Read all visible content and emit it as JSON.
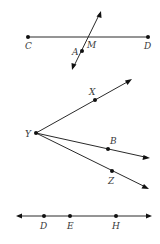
{
  "figures": {
    "segment_cd": {
      "labels": {
        "c": "C",
        "d": "D",
        "m": "M",
        "a": "A"
      },
      "description": "Segment CD with a line through M and point A crossing it"
    },
    "rays_y": {
      "labels": {
        "y": "Y",
        "x": "X",
        "b": "B",
        "z": "Z"
      },
      "description": "Three rays from common endpoint Y through X, B, and Z"
    },
    "line_deh": {
      "labels": {
        "d": "D",
        "e": "E",
        "h": "H"
      },
      "description": "Line with arrows at both ends containing points D, E, H"
    }
  },
  "colors": {
    "stroke": "#2a2a2a",
    "point": "#111111",
    "label": "#3a3a3a",
    "background": "#ffffff"
  }
}
